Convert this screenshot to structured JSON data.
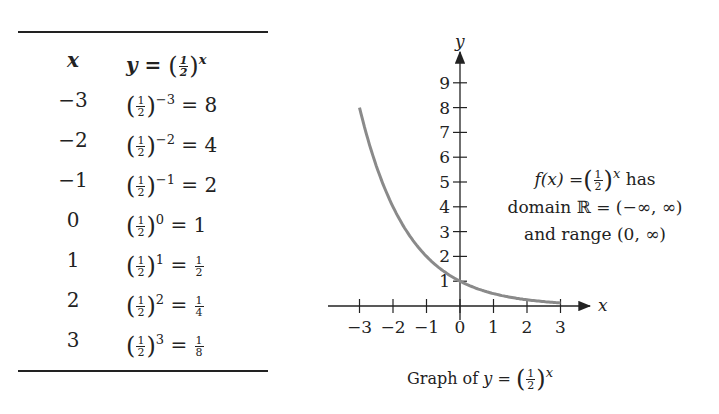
{
  "table": {
    "header_x": "x",
    "header_y_prefix": "y =",
    "header_base": {
      "num": "1",
      "den": "2"
    },
    "header_exp": "x",
    "rows": [
      {
        "x": "−3",
        "exp": "−3",
        "result": "8"
      },
      {
        "x": "−2",
        "exp": "−2",
        "result": "4"
      },
      {
        "x": "−1",
        "exp": "−1",
        "result": "2"
      },
      {
        "x": "0",
        "exp": "0",
        "result": "1"
      },
      {
        "x": "1",
        "exp": "1",
        "result_num": "1",
        "result_den": "2"
      },
      {
        "x": "2",
        "exp": "2",
        "result_num": "1",
        "result_den": "4"
      },
      {
        "x": "3",
        "exp": "3",
        "result_num": "1",
        "result_den": "8"
      }
    ]
  },
  "annotation": {
    "line1_prefix": "f(x) =",
    "line1_exp": "x",
    "line1_suffix": "has",
    "line2": "domain ℝ = (−∞, ∞)",
    "line3": "and range (0, ∞)"
  },
  "caption": {
    "prefix": "Graph of",
    "var": "y",
    "eq": "=",
    "exp": "x"
  },
  "chart_data": {
    "type": "line",
    "xlabel": "x",
    "ylabel": "y",
    "x_ticks": [
      -3,
      -2,
      -1,
      0,
      1,
      2,
      3
    ],
    "y_ticks": [
      1,
      2,
      3,
      4,
      5,
      6,
      7,
      8,
      9
    ],
    "xlim": [
      -3.5,
      3.8
    ],
    "ylim": [
      0,
      9.3
    ],
    "grid": false,
    "series": [
      {
        "name": "y = (1/2)^x",
        "x": [
          -3,
          -2,
          -1,
          0,
          1,
          2,
          3
        ],
        "y": [
          8,
          4,
          2,
          1,
          0.5,
          0.25,
          0.125
        ],
        "color": "#8a8a8a"
      }
    ]
  }
}
